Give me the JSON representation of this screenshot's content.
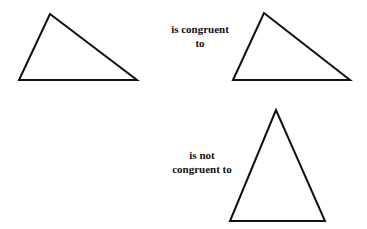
{
  "diagram": {
    "stroke_color": "#111111",
    "triangles": [
      {
        "id": "reference",
        "points": "50,14 19,80 137,80"
      },
      {
        "id": "congruent",
        "points": "264,13 233,80 350,80"
      },
      {
        "id": "not-congruent",
        "points": "276,110 230,221 325,221"
      }
    ],
    "labels": {
      "congruent_line1": "is congruent",
      "congruent_line2": "to",
      "not_congruent_line1": "is not",
      "not_congruent_line2": "congruent to"
    }
  }
}
